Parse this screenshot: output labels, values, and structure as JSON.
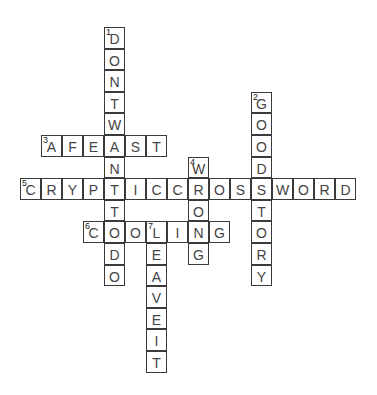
{
  "puzzle": {
    "cell_width": 21,
    "cell_height": 21.6,
    "line_color": "#3a3a3a",
    "letter_color": "#444444",
    "words": [
      {
        "number": "1",
        "direction": "down",
        "answer": "DONTWANTTODO",
        "row": 0,
        "col": 4
      },
      {
        "number": "2",
        "direction": "down",
        "answer": "GOODSTORY",
        "row": 3,
        "col": 11
      },
      {
        "number": "3",
        "direction": "across",
        "answer": "AFEAST",
        "row": 5,
        "col": 1
      },
      {
        "number": "4",
        "direction": "down",
        "answer": "WRONG",
        "row": 6,
        "col": 8
      },
      {
        "number": "5",
        "direction": "across",
        "answer": "CRYPTICCROSSWORD",
        "row": 7,
        "col": 0
      },
      {
        "number": "6",
        "direction": "across",
        "answer": "COOLING",
        "row": 9,
        "col": 3
      },
      {
        "number": "7",
        "direction": "down",
        "answer": "LEAVEIT",
        "row": 9,
        "col": 6
      }
    ]
  }
}
